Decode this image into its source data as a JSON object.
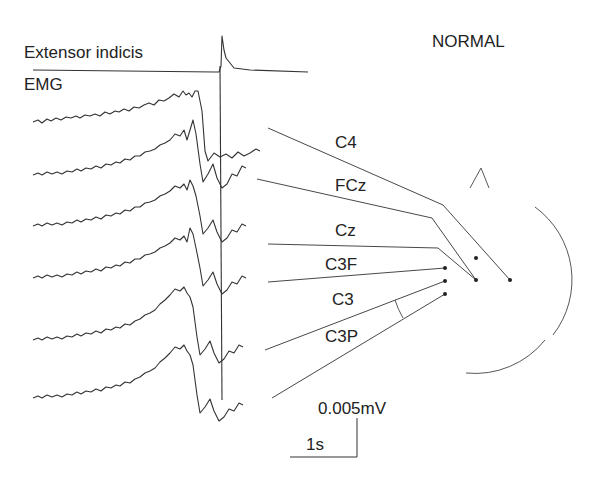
{
  "figure": {
    "title": "NORMAL",
    "muscle_label_line1": "Extensor indicis",
    "muscle_label_line2": "EMG",
    "channels": [
      {
        "name": "C4"
      },
      {
        "name": "FCz"
      },
      {
        "name": "Cz"
      },
      {
        "name": "C3F"
      },
      {
        "name": "C3"
      },
      {
        "name": "C3P"
      }
    ],
    "scale": {
      "amplitude": "0.005mV",
      "time": "1s"
    },
    "colors": {
      "trace": "#333333",
      "background": "#ffffff"
    }
  }
}
